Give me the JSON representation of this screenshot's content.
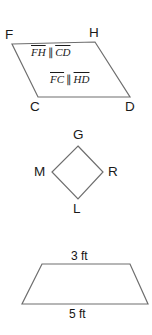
{
  "canvas": {
    "width": 152,
    "height": 335,
    "background": "#ffffff"
  },
  "style": {
    "stroke_color": "#6e6e6e",
    "text_color": "#1a1a1a",
    "stroke_width": 1.2
  },
  "figures": {
    "parallelogram": {
      "name": "parallelogram-FHDC",
      "vertices": {
        "F": "F",
        "H": "H",
        "D": "D",
        "C": "C"
      },
      "statements": [
        {
          "left": "FH",
          "relation": "∥",
          "right": "CD"
        },
        {
          "left": "FC",
          "relation": "∥",
          "right": "HD"
        }
      ]
    },
    "rhombus": {
      "name": "rhombus-GRLM",
      "vertices": {
        "G": "G",
        "R": "R",
        "L": "L",
        "M": "M"
      }
    },
    "trapezoid": {
      "name": "trapezoid",
      "top_length": "3 ft",
      "bottom_length": "5 ft"
    }
  }
}
